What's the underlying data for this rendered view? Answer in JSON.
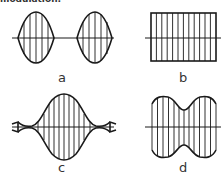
{
  "heading": "modulation:",
  "panels": [
    {
      "id": "a",
      "label": "a",
      "description": "Two separate pulse lobes (on-off keyed carrier bursts)"
    },
    {
      "id": "b",
      "label": "b",
      "description": "Unmodulated constant-amplitude carrier"
    },
    {
      "id": "c",
      "label": "c",
      "description": "Single amplitude-modulated pulse with tapered ends"
    },
    {
      "id": "d",
      "label": "d",
      "description": "Carrier with amplitude dip in the middle"
    }
  ],
  "colors": {
    "stroke": "#1a1a1a",
    "background": "#ffffff",
    "label": "#333333"
  }
}
